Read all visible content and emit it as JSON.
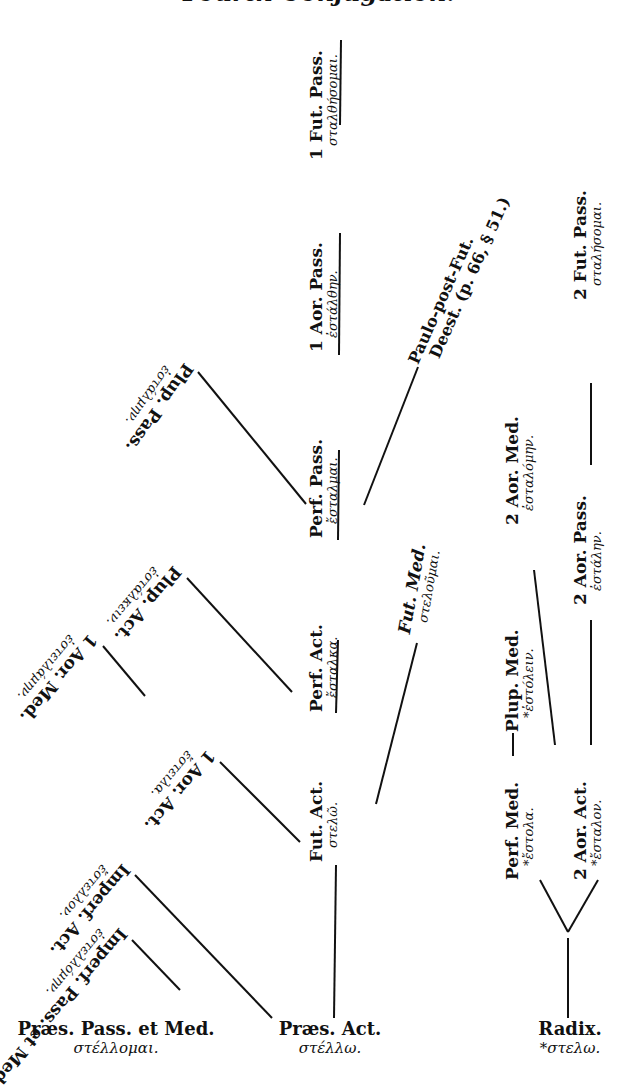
{
  "title": "Fourth Conjugation.",
  "bases": [
    {
      "id": "praes-pass-med",
      "label": "Præs. Pass. et Med.",
      "greek": "στέλλομαι."
    },
    {
      "id": "praes-act",
      "label": "Præs. Act.",
      "greek": "στέλλω."
    },
    {
      "id": "radix",
      "label": "Radix.",
      "greek": "*στελω."
    }
  ],
  "nodes": {
    "fut_act": {
      "label": "Fut. Act.",
      "greek": "στελῶ."
    },
    "perf_act": {
      "label": "Perf. Act.",
      "greek": "ἔσταλκα."
    },
    "perf_pass": {
      "label": "Perf. Pass.",
      "greek": "ἔσταλμαι."
    },
    "aor1_pass": {
      "label": "1 Aor. Pass.",
      "greek": "ἐστάλθην."
    },
    "fut1_pass": {
      "label": "1 Fut. Pass.",
      "greek": "σταλθήσομαι."
    },
    "plup_pass": {
      "label": "Plup. Pass.",
      "greek": "ἐστάλμην."
    },
    "plup_act": {
      "label": "Plup. Act.",
      "greek": "ἐστάλκειν."
    },
    "aor1_med": {
      "label": "1 Aor. Med.",
      "greek": "ἐστειλάμην."
    },
    "aor1_act": {
      "label": "1 Aor. Act.",
      "greek": "ἔστειλα."
    },
    "imperf_act": {
      "label": "Imperf. Act.",
      "greek": "ἔστελλον."
    },
    "imperf_pass_med": {
      "label": "Imperf. Pass. et Med.",
      "greek": "ἐστελλόμην."
    },
    "paulo_post": {
      "label": "Paulo-post-Fut.",
      "greek": "Deest. (p. 66, § 51.)"
    },
    "fut_med": {
      "label": "Fut. Med.",
      "greek": "στελοῦμαι."
    },
    "perf_med": {
      "label": "Perf. Med.",
      "greek": "*ἔστολα."
    },
    "plup_med": {
      "label": "Plup. Med.",
      "greek": "*ἐστόλειν."
    },
    "aor2_med": {
      "label": "2 Aor. Med.",
      "greek": "ἐσταλόμην."
    },
    "aor2_act": {
      "label": "2 Aor. Act.",
      "greek": "*ἔσταλον."
    },
    "aor2_pass": {
      "label": "2 Aor. Pass.",
      "greek": "ἐστάλην."
    },
    "fut2_pass": {
      "label": "2 Fut. Pass.",
      "greek": "σταλήσομαι."
    }
  }
}
